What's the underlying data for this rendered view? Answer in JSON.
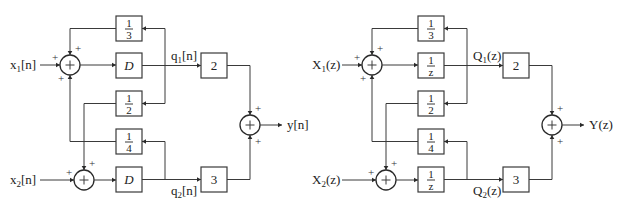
{
  "diagrams": [
    {
      "name": "time-domain",
      "input1": {
        "base": "x",
        "sub": "1",
        "arg": "[n]"
      },
      "input2": {
        "base": "x",
        "sub": "2",
        "arg": "[n]"
      },
      "state1": {
        "base": "q",
        "sub": "1",
        "arg": "[n]"
      },
      "state2": {
        "base": "q",
        "sub": "2",
        "arg": "[n]"
      },
      "output": {
        "base": "y",
        "arg": "[n]"
      },
      "delay_label": "D",
      "delay_is_fraction": false,
      "gains": {
        "g13": {
          "num": "1",
          "den": "3"
        },
        "g12": {
          "num": "1",
          "den": "2"
        },
        "g14": {
          "num": "1",
          "den": "4"
        },
        "out1": "2",
        "out2": "3"
      },
      "sign": "+"
    },
    {
      "name": "z-domain",
      "input1": {
        "base": "X",
        "sub": "1",
        "arg": "(z)"
      },
      "input2": {
        "base": "X",
        "sub": "2",
        "arg": "(z)"
      },
      "state1": {
        "base": "Q",
        "sub": "1",
        "arg": "(z)"
      },
      "state2": {
        "base": "Q",
        "sub": "2",
        "arg": "(z)"
      },
      "output": {
        "base": "Y",
        "arg": "(z)"
      },
      "delay_label": {
        "num": "1",
        "den": "z"
      },
      "delay_is_fraction": true,
      "gains": {
        "g13": {
          "num": "1",
          "den": "3"
        },
        "g12": {
          "num": "1",
          "den": "2"
        },
        "g14": {
          "num": "1",
          "den": "4"
        },
        "out1": "2",
        "out2": "3"
      },
      "sign": "+"
    }
  ]
}
